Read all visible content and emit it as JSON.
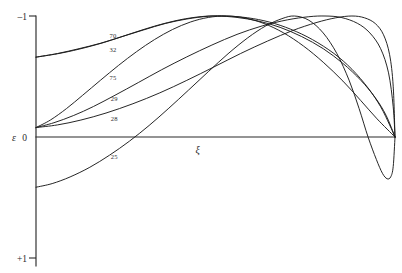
{
  "figure": {
    "background_color": "#ffffff",
    "line_color": "#1a1a1a",
    "axis_color": "#2b2b2b"
  },
  "axes": {
    "y_label": "ε",
    "x_label": "ξ",
    "y_tick_top": "–1",
    "y_tick_origin": "0",
    "y_tick_bottom": "+1"
  },
  "chart_data": {
    "type": "line",
    "title": "",
    "xlabel": "ξ",
    "ylabel": "ε",
    "xlim": [
      0,
      1
    ],
    "ylim": [
      1,
      -1
    ],
    "grid": false,
    "legend": "inline-curve-labels",
    "y_ticks": [
      {
        "value": -1,
        "label": "–1"
      },
      {
        "value": 0,
        "label": "0"
      },
      {
        "value": 1,
        "label": "+1"
      }
    ],
    "x_ticks": [],
    "note": "Axis is inverted: ε = –1 at top, 0 at centre, +1 at bottom. All curves terminate together at the right-hand end of the ξ axis where ε = 0.",
    "series": [
      {
        "name": "70",
        "label": "70",
        "label_x": 0.205,
        "label_y": -0.815,
        "points": [
          [
            0.0,
            -0.66
          ],
          [
            0.06,
            -0.69
          ],
          [
            0.12,
            -0.73
          ],
          [
            0.18,
            -0.775
          ],
          [
            0.24,
            -0.83
          ],
          [
            0.3,
            -0.885
          ],
          [
            0.36,
            -0.938
          ],
          [
            0.42,
            -0.975
          ],
          [
            0.48,
            -0.998
          ],
          [
            0.53,
            -1.0
          ],
          [
            0.59,
            -0.985
          ],
          [
            0.65,
            -0.95
          ],
          [
            0.71,
            -0.89
          ],
          [
            0.77,
            -0.805
          ],
          [
            0.83,
            -0.69
          ],
          [
            0.88,
            -0.56
          ],
          [
            0.925,
            -0.405
          ],
          [
            0.96,
            -0.25
          ],
          [
            0.985,
            -0.1
          ],
          [
            1.0,
            0.0
          ]
        ]
      },
      {
        "name": "32",
        "label": "32",
        "label_x": 0.205,
        "label_y": -0.7,
        "points": [
          [
            0.0,
            -0.66
          ],
          [
            0.06,
            -0.688
          ],
          [
            0.12,
            -0.726
          ],
          [
            0.19,
            -0.782
          ],
          [
            0.26,
            -0.85
          ],
          [
            0.33,
            -0.916
          ],
          [
            0.4,
            -0.968
          ],
          [
            0.46,
            -0.995
          ],
          [
            0.505,
            -1.0
          ],
          [
            0.56,
            -0.988
          ],
          [
            0.62,
            -0.958
          ],
          [
            0.68,
            -0.906
          ],
          [
            0.74,
            -0.83
          ],
          [
            0.8,
            -0.73
          ],
          [
            0.855,
            -0.608
          ],
          [
            0.905,
            -0.468
          ],
          [
            0.945,
            -0.325
          ],
          [
            0.975,
            -0.18
          ],
          [
            1.0,
            0.0
          ]
        ]
      },
      {
        "name": "75",
        "label": "75",
        "label_x": 0.205,
        "label_y": -0.47,
        "points": [
          [
            0.0,
            -0.078
          ],
          [
            0.04,
            -0.14
          ],
          [
            0.085,
            -0.235
          ],
          [
            0.13,
            -0.345
          ],
          [
            0.18,
            -0.47
          ],
          [
            0.23,
            -0.592
          ],
          [
            0.28,
            -0.705
          ],
          [
            0.33,
            -0.805
          ],
          [
            0.38,
            -0.888
          ],
          [
            0.43,
            -0.95
          ],
          [
            0.48,
            -0.988
          ],
          [
            0.53,
            -1.0
          ],
          [
            0.58,
            -0.985
          ],
          [
            0.635,
            -0.938
          ],
          [
            0.69,
            -0.86
          ],
          [
            0.745,
            -0.752
          ],
          [
            0.8,
            -0.618
          ],
          [
            0.855,
            -0.462
          ],
          [
            0.905,
            -0.3
          ],
          [
            0.95,
            -0.15
          ],
          [
            1.0,
            0.0
          ]
        ]
      },
      {
        "name": "29",
        "label": "29",
        "label_x": 0.208,
        "label_y": -0.3,
        "points": [
          [
            0.0,
            -0.078
          ],
          [
            0.05,
            -0.118
          ],
          [
            0.105,
            -0.178
          ],
          [
            0.16,
            -0.252
          ],
          [
            0.22,
            -0.345
          ],
          [
            0.285,
            -0.45
          ],
          [
            0.35,
            -0.556
          ],
          [
            0.42,
            -0.662
          ],
          [
            0.49,
            -0.76
          ],
          [
            0.56,
            -0.848
          ],
          [
            0.63,
            -0.918
          ],
          [
            0.7,
            -0.968
          ],
          [
            0.76,
            -0.994
          ],
          [
            0.805,
            -1.0
          ],
          [
            0.85,
            -0.988
          ],
          [
            0.895,
            -0.94
          ],
          [
            0.93,
            -0.86
          ],
          [
            0.96,
            -0.73
          ],
          [
            0.982,
            -0.53
          ],
          [
            0.995,
            -0.25
          ],
          [
            1.0,
            0.0
          ]
        ]
      },
      {
        "name": "28",
        "label": "28",
        "label_x": 0.208,
        "label_y": -0.135,
        "points": [
          [
            0.0,
            -0.078
          ],
          [
            0.06,
            -0.1
          ],
          [
            0.125,
            -0.14
          ],
          [
            0.195,
            -0.198
          ],
          [
            0.27,
            -0.275
          ],
          [
            0.345,
            -0.365
          ],
          [
            0.42,
            -0.468
          ],
          [
            0.495,
            -0.578
          ],
          [
            0.57,
            -0.69
          ],
          [
            0.645,
            -0.793
          ],
          [
            0.715,
            -0.88
          ],
          [
            0.78,
            -0.945
          ],
          [
            0.835,
            -0.985
          ],
          [
            0.88,
            -1.0
          ],
          [
            0.915,
            -0.985
          ],
          [
            0.945,
            -0.938
          ],
          [
            0.968,
            -0.845
          ],
          [
            0.985,
            -0.68
          ],
          [
            0.995,
            -0.42
          ],
          [
            1.0,
            0.0
          ]
        ]
      },
      {
        "name": "25",
        "label": "25",
        "label_x": 0.208,
        "label_y": 0.185,
        "points": [
          [
            0.0,
            0.415
          ],
          [
            0.045,
            0.385
          ],
          [
            0.095,
            0.33
          ],
          [
            0.15,
            0.25
          ],
          [
            0.205,
            0.15
          ],
          [
            0.26,
            0.035
          ],
          [
            0.315,
            -0.095
          ],
          [
            0.37,
            -0.238
          ],
          [
            0.425,
            -0.388
          ],
          [
            0.48,
            -0.54
          ],
          [
            0.535,
            -0.688
          ],
          [
            0.59,
            -0.82
          ],
          [
            0.64,
            -0.918
          ],
          [
            0.685,
            -0.978
          ],
          [
            0.72,
            -1.0
          ],
          [
            0.76,
            -0.965
          ],
          [
            0.8,
            -0.86
          ],
          [
            0.838,
            -0.69
          ],
          [
            0.872,
            -0.47
          ],
          [
            0.9,
            -0.235
          ],
          [
            0.925,
            0.0
          ],
          [
            0.948,
            0.185
          ],
          [
            0.965,
            0.3
          ],
          [
            0.978,
            0.345
          ],
          [
            0.988,
            0.33
          ],
          [
            0.995,
            0.245
          ],
          [
            1.0,
            0.0
          ]
        ]
      }
    ]
  }
}
